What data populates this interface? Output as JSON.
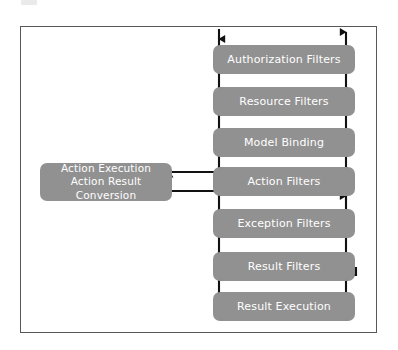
{
  "diagram": {
    "frame_label": "",
    "colors": {
      "box_fill": "#919191",
      "box_text": "#ffffff",
      "frame_border": "#585858",
      "wire": "#111111",
      "background": "#ffffff"
    },
    "stages": [
      {
        "name": "authorization-filters",
        "label": "Authorization Filters"
      },
      {
        "name": "resource-filters",
        "label": "Resource Filters"
      },
      {
        "name": "model-binding",
        "label": "Model Binding"
      },
      {
        "name": "action-filters",
        "label": "Action Filters"
      },
      {
        "name": "exception-filters",
        "label": "Exception Filters"
      },
      {
        "name": "result-filters",
        "label": "Result Filters"
      },
      {
        "name": "result-execution",
        "label": "Result Execution"
      }
    ],
    "side_box": {
      "name": "action-execution",
      "line1": "Action Execution",
      "line2": "Action Result Conversion"
    },
    "flow": {
      "entry_label": "",
      "exit_label": "",
      "direction": "top-down then return up right side"
    }
  }
}
